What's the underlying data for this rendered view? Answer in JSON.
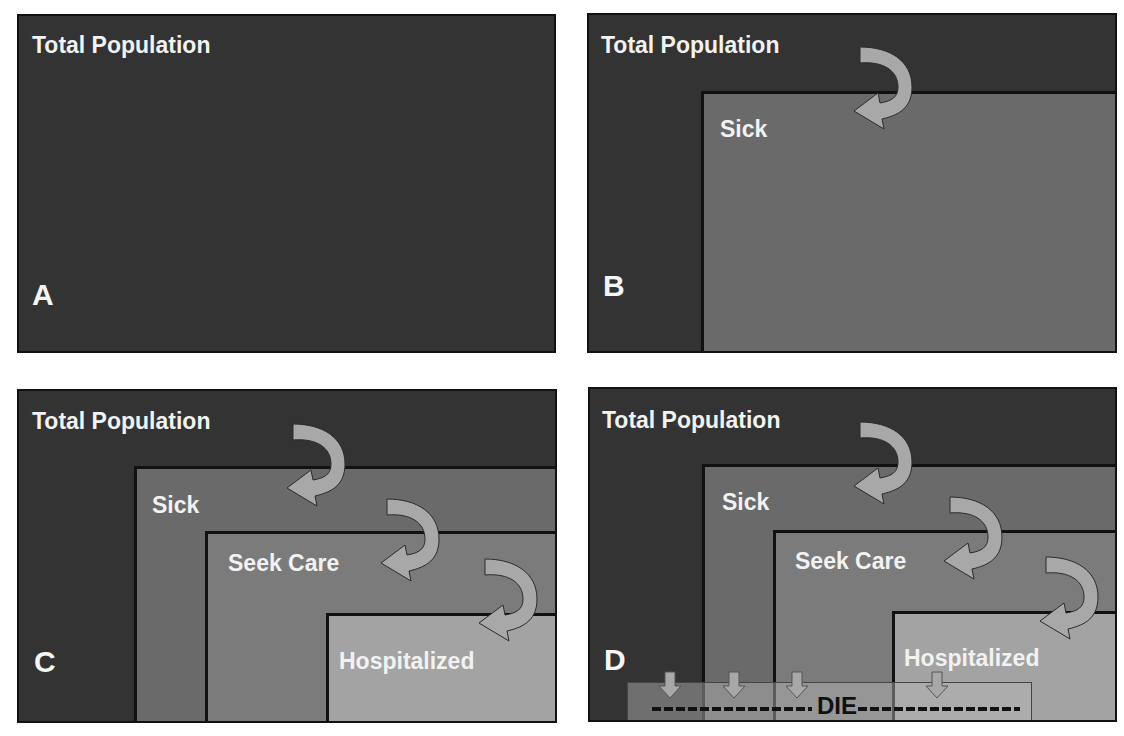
{
  "colors": {
    "total_population": "#333333",
    "sick": "#6a6a6a",
    "seek_care": "#7b7b7b",
    "hospitalized": "#a3a3a3",
    "arrow_fill": "#a8a8a8",
    "border": "#111111",
    "text": "#f2f2f2"
  },
  "panels": [
    {
      "letter": "A",
      "labels": {
        "total": "Total Population"
      }
    },
    {
      "letter": "B",
      "labels": {
        "total": "Total Population",
        "sick": "Sick"
      }
    },
    {
      "letter": "C",
      "labels": {
        "total": "Total Population",
        "sick": "Sick",
        "seek": "Seek Care",
        "hosp": "Hospitalized"
      }
    },
    {
      "letter": "D",
      "labels": {
        "total": "Total Population",
        "sick": "Sick",
        "seek": "Seek Care",
        "hosp": "Hospitalized",
        "die": "DIE"
      }
    }
  ],
  "icons": {
    "curved_arrow": "curved-arrow-icon",
    "down_arrow": "down-arrow-icon"
  }
}
